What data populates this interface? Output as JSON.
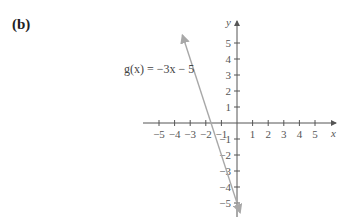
{
  "panel": {
    "label": "(b)"
  },
  "chart_data": {
    "type": "line",
    "title": "",
    "xlabel": "x",
    "ylabel": "y",
    "xlim": [
      -5.5,
      5.8
    ],
    "ylim": [
      -5.6,
      5.6
    ],
    "x_ticks": [
      -5,
      -4,
      -3,
      -2,
      -1,
      1,
      2,
      3,
      4,
      5
    ],
    "y_ticks": [
      -5,
      -4,
      -3,
      -2,
      -1,
      1,
      2,
      3,
      4,
      5
    ],
    "x_tick_labels": [
      "−5",
      "−4",
      "−3",
      "−2",
      "−1",
      "1",
      "2",
      "3",
      "4",
      "5"
    ],
    "y_tick_labels": [
      "−5",
      "−4",
      "−3",
      "−2",
      "−1",
      "1",
      "2",
      "3",
      "4",
      "5"
    ],
    "grid": false,
    "series": [
      {
        "name": "g(x) = −3x − 5",
        "equation": "g(x) = -3x - 5",
        "slope": -3,
        "intercept": -5,
        "x": [
          -3.5,
          0.2
        ],
        "y": [
          5.5,
          -5.6
        ],
        "color": "#a8a8a8",
        "arrows": "both"
      }
    ],
    "annotations": [
      {
        "text": "g(x) = −3x − 5",
        "x": -5.8,
        "y": 3.3
      }
    ]
  },
  "labels": {
    "function": "g(x) = −3x − 5",
    "x_axis": "x",
    "y_axis": "y"
  },
  "colors": {
    "axis": "#555555",
    "line": "#a8a8a8",
    "text": "#555555"
  }
}
